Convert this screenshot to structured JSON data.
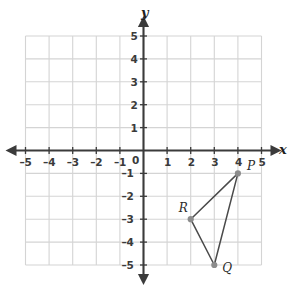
{
  "chart_data": {
    "type": "scatter",
    "title": "",
    "xlabel": "x",
    "ylabel": "y",
    "grid": true,
    "legend": "none",
    "xlim": [
      -5,
      5
    ],
    "ylim": [
      -5,
      5
    ],
    "xticks": [
      "-5",
      "-4",
      "-3",
      "-2",
      "-1",
      "0",
      "1",
      "2",
      "3",
      "4",
      "5"
    ],
    "yticks": [
      "5",
      "4",
      "3",
      "2",
      "1",
      "-1",
      "-2",
      "-3",
      "-4",
      "-5"
    ],
    "origin_label": "0",
    "points": [
      {
        "label": "P",
        "x": 4,
        "y": -1
      },
      {
        "label": "Q",
        "x": 3,
        "y": -5
      },
      {
        "label": "R",
        "x": 2,
        "y": -3
      }
    ],
    "shape": {
      "kind": "triangle",
      "vertices": [
        "P",
        "Q",
        "R"
      ],
      "edges": [
        [
          "P",
          "Q"
        ],
        [
          "Q",
          "R"
        ],
        [
          "R",
          "P"
        ]
      ]
    },
    "annotations": []
  },
  "axes": {
    "x_axis_name": "x",
    "y_axis_name": "y"
  },
  "colors": {
    "grid": "#d4d4d4",
    "axis": "#3b3b3b",
    "label": "#3a3a3a",
    "shape_stroke": "#4a4a4a",
    "point_fill": "#8c8c8c"
  },
  "ticks": {
    "x": [
      {
        "value": -5,
        "text": "-5"
      },
      {
        "value": -4,
        "text": "-4"
      },
      {
        "value": -3,
        "text": "-3"
      },
      {
        "value": -2,
        "text": "-2"
      },
      {
        "value": -1,
        "text": "-1"
      },
      {
        "value": 1,
        "text": "1"
      },
      {
        "value": 2,
        "text": "2"
      },
      {
        "value": 3,
        "text": "3"
      },
      {
        "value": 4,
        "text": "4"
      },
      {
        "value": 5,
        "text": "5"
      }
    ],
    "y": [
      {
        "value": 5,
        "text": "5"
      },
      {
        "value": 4,
        "text": "4"
      },
      {
        "value": 3,
        "text": "3"
      },
      {
        "value": 2,
        "text": "2"
      },
      {
        "value": 1,
        "text": "1"
      },
      {
        "value": -1,
        "text": "-1"
      },
      {
        "value": -2,
        "text": "-2"
      },
      {
        "value": -3,
        "text": "-3"
      },
      {
        "value": -4,
        "text": "-4"
      },
      {
        "value": -5,
        "text": "-5"
      }
    ],
    "origin": "0"
  },
  "point_labels": {
    "P": "P",
    "Q": "Q",
    "R": "R"
  }
}
